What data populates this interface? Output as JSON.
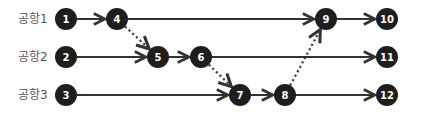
{
  "lanes": [
    {
      "id": "lane1",
      "label": "공항1"
    },
    {
      "id": "lane2",
      "label": "공항2"
    },
    {
      "id": "lane3",
      "label": "공항3"
    }
  ],
  "nodes": [
    {
      "id": "1",
      "label": "1",
      "lane": 0
    },
    {
      "id": "4",
      "label": "4",
      "lane": 0
    },
    {
      "id": "9",
      "label": "9",
      "lane": 0
    },
    {
      "id": "10",
      "label": "10",
      "lane": 0
    },
    {
      "id": "2",
      "label": "2",
      "lane": 1
    },
    {
      "id": "5",
      "label": "5",
      "lane": 1
    },
    {
      "id": "6",
      "label": "6",
      "lane": 1
    },
    {
      "id": "11",
      "label": "11",
      "lane": 1
    },
    {
      "id": "3",
      "label": "3",
      "lane": 2
    },
    {
      "id": "7",
      "label": "7",
      "lane": 2
    },
    {
      "id": "8",
      "label": "8",
      "lane": 2
    },
    {
      "id": "12",
      "label": "12",
      "lane": 2
    }
  ],
  "edges": [
    {
      "from": "1",
      "to": "4",
      "style": "solid"
    },
    {
      "from": "4",
      "to": "9",
      "style": "solid"
    },
    {
      "from": "9",
      "to": "10",
      "style": "solid"
    },
    {
      "from": "2",
      "to": "5",
      "style": "solid"
    },
    {
      "from": "5",
      "to": "6",
      "style": "solid"
    },
    {
      "from": "6",
      "to": "11",
      "style": "solid"
    },
    {
      "from": "3",
      "to": "7",
      "style": "solid"
    },
    {
      "from": "7",
      "to": "8",
      "style": "solid"
    },
    {
      "from": "8",
      "to": "12",
      "style": "solid"
    },
    {
      "from": "4",
      "to": "5",
      "style": "dotted"
    },
    {
      "from": "6",
      "to": "7",
      "style": "dotted"
    },
    {
      "from": "8",
      "to": "9",
      "style": "dotted"
    }
  ],
  "colors": {
    "node": "#1e1e1e",
    "edge": "#333333",
    "label": "#555555"
  }
}
